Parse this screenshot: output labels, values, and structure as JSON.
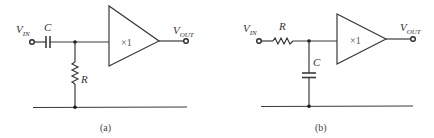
{
  "figure": {
    "circuits": [
      {
        "id": "a",
        "caption": "(a)",
        "type": "high-pass RC filter with unity-gain buffer",
        "input_label": "V",
        "input_sub": "IN",
        "output_label": "V",
        "output_sub": "OUT",
        "series_component": "C",
        "shunt_component": "R",
        "amplifier_gain": "×1"
      },
      {
        "id": "b",
        "caption": "(b)",
        "type": "low-pass RC filter with unity-gain buffer",
        "input_label": "V",
        "input_sub": "IN",
        "output_label": "V",
        "output_sub": "OUT",
        "series_component": "R",
        "shunt_component": "C",
        "amplifier_gain": "×1"
      }
    ]
  }
}
